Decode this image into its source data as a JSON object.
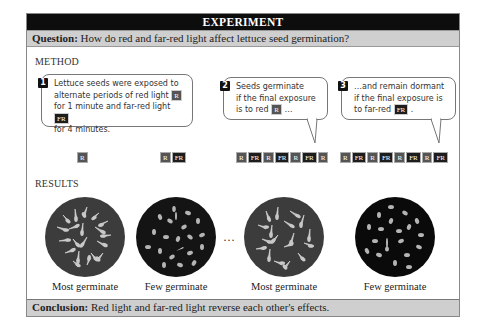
{
  "header": {
    "title": "EXPERIMENT"
  },
  "question": {
    "label": "Question:",
    "text": " How do red and far-red light affect lettuce seed germination?"
  },
  "method": {
    "heading": "METHOD",
    "steps": [
      {
        "number": "1",
        "text_lines": [
          "Lettuce seeds were exposed to",
          "alternate periods of red light",
          "for 1 minute and far-red light",
          "for 4 minutes."
        ],
        "inline_tags": [
          "R",
          "FR"
        ]
      },
      {
        "number": "2",
        "text_lines": [
          "Seeds germinate",
          "if the final exposure",
          "is to red",
          "…"
        ],
        "inline_tags": [
          "R"
        ]
      },
      {
        "number": "3",
        "text_lines": [
          "…and remain dormant",
          "if the final exposure is",
          "to far-red",
          "."
        ],
        "inline_tags": [
          "FR"
        ]
      }
    ],
    "sequences": [
      [
        "R"
      ],
      [
        "R",
        "FR"
      ],
      [
        "R",
        "FR",
        "R",
        "FR",
        "R",
        "FR",
        "R"
      ],
      [
        "R",
        "FR",
        "R",
        "FR",
        "R",
        "FR",
        "R",
        "FR"
      ]
    ]
  },
  "results": {
    "heading": "RESULTS",
    "ellipsis": "…",
    "dishes": [
      {
        "label": "Most germinate",
        "color": "#3c3c3c"
      },
      {
        "label": "Few germinate",
        "color": "#141414"
      },
      {
        "label": "Most germinate",
        "color": "#3c3c3c"
      },
      {
        "label": "Few germinate",
        "color": "#0a0a0a"
      }
    ]
  },
  "conclusion": {
    "label": "Conclusion:",
    "text": " Red light and far-red light reverse each other's effects."
  },
  "colors": {
    "red_tag": "#555555",
    "far_red_tag": "#1d1d1d",
    "bar_bg": "#cfcfcf",
    "header_bg": "#0d0d0d"
  }
}
